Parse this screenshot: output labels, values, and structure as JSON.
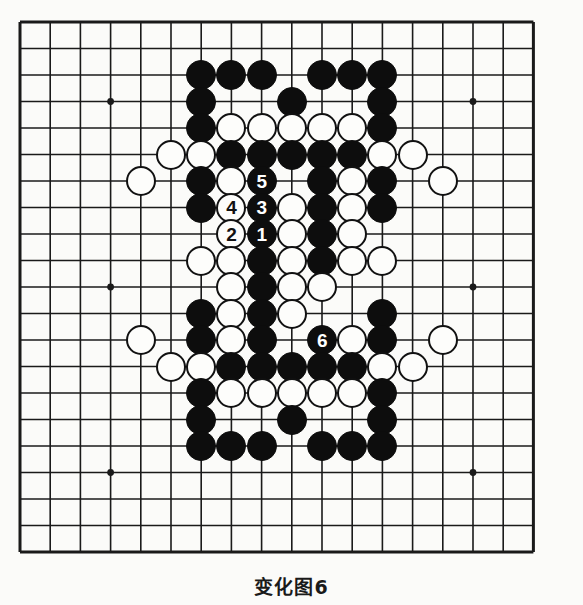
{
  "caption": {
    "text": "变化图6"
  },
  "board": {
    "name": "go-board",
    "cols": 18,
    "rows": 21,
    "origin_x": 20,
    "origin_y": 22,
    "step_x": 30.2,
    "step_y": 26.5,
    "line_color": "#1a1a1a",
    "border_color": "#1a1a1a",
    "background_color": "#fbfbf9",
    "star_points": [
      {
        "c": 3,
        "r": 3
      },
      {
        "c": 3,
        "r": 10
      },
      {
        "c": 3,
        "r": 17
      },
      {
        "c": 15,
        "r": 3
      },
      {
        "c": 15,
        "r": 10
      },
      {
        "c": 15,
        "r": 17
      }
    ],
    "stone_radius": 15,
    "black_color": "#0d0d0d",
    "white_color": "#fdfdfb"
  },
  "stones": [
    {
      "c": 6,
      "r": 2,
      "color": "black",
      "label": ""
    },
    {
      "c": 7,
      "r": 2,
      "color": "black",
      "label": ""
    },
    {
      "c": 8,
      "r": 2,
      "color": "black",
      "label": ""
    },
    {
      "c": 10,
      "r": 2,
      "color": "black",
      "label": ""
    },
    {
      "c": 11,
      "r": 2,
      "color": "black",
      "label": ""
    },
    {
      "c": 12,
      "r": 2,
      "color": "black",
      "label": ""
    },
    {
      "c": 6,
      "r": 3,
      "color": "black",
      "label": ""
    },
    {
      "c": 9,
      "r": 3,
      "color": "black",
      "label": ""
    },
    {
      "c": 12,
      "r": 3,
      "color": "black",
      "label": ""
    },
    {
      "c": 6,
      "r": 4,
      "color": "black",
      "label": ""
    },
    {
      "c": 7,
      "r": 4,
      "color": "white",
      "label": ""
    },
    {
      "c": 8,
      "r": 4,
      "color": "white",
      "label": ""
    },
    {
      "c": 9,
      "r": 4,
      "color": "white",
      "label": ""
    },
    {
      "c": 10,
      "r": 4,
      "color": "white",
      "label": ""
    },
    {
      "c": 11,
      "r": 4,
      "color": "white",
      "label": ""
    },
    {
      "c": 12,
      "r": 4,
      "color": "black",
      "label": ""
    },
    {
      "c": 5,
      "r": 5,
      "color": "white",
      "label": ""
    },
    {
      "c": 6,
      "r": 5,
      "color": "white",
      "label": ""
    },
    {
      "c": 7,
      "r": 5,
      "color": "black",
      "label": ""
    },
    {
      "c": 8,
      "r": 5,
      "color": "black",
      "label": ""
    },
    {
      "c": 9,
      "r": 5,
      "color": "black",
      "label": ""
    },
    {
      "c": 10,
      "r": 5,
      "color": "black",
      "label": ""
    },
    {
      "c": 11,
      "r": 5,
      "color": "black",
      "label": ""
    },
    {
      "c": 12,
      "r": 5,
      "color": "white",
      "label": ""
    },
    {
      "c": 13,
      "r": 5,
      "color": "white",
      "label": ""
    },
    {
      "c": 4,
      "r": 6,
      "color": "white",
      "label": ""
    },
    {
      "c": 6,
      "r": 6,
      "color": "black",
      "label": ""
    },
    {
      "c": 7,
      "r": 6,
      "color": "white",
      "label": ""
    },
    {
      "c": 8,
      "r": 6,
      "color": "black",
      "label": "5"
    },
    {
      "c": 10,
      "r": 6,
      "color": "black",
      "label": ""
    },
    {
      "c": 11,
      "r": 6,
      "color": "white",
      "label": ""
    },
    {
      "c": 12,
      "r": 6,
      "color": "black",
      "label": ""
    },
    {
      "c": 14,
      "r": 6,
      "color": "white",
      "label": ""
    },
    {
      "c": 6,
      "r": 7,
      "color": "black",
      "label": ""
    },
    {
      "c": 7,
      "r": 7,
      "color": "white",
      "label": "4"
    },
    {
      "c": 8,
      "r": 7,
      "color": "black",
      "label": "3"
    },
    {
      "c": 9,
      "r": 7,
      "color": "white",
      "label": ""
    },
    {
      "c": 10,
      "r": 7,
      "color": "black",
      "label": ""
    },
    {
      "c": 11,
      "r": 7,
      "color": "white",
      "label": ""
    },
    {
      "c": 12,
      "r": 7,
      "color": "black",
      "label": ""
    },
    {
      "c": 7,
      "r": 8,
      "color": "white",
      "label": "2"
    },
    {
      "c": 8,
      "r": 8,
      "color": "black",
      "label": "1"
    },
    {
      "c": 9,
      "r": 8,
      "color": "white",
      "label": ""
    },
    {
      "c": 10,
      "r": 8,
      "color": "black",
      "label": ""
    },
    {
      "c": 11,
      "r": 8,
      "color": "white",
      "label": ""
    },
    {
      "c": 6,
      "r": 9,
      "color": "white",
      "label": ""
    },
    {
      "c": 7,
      "r": 9,
      "color": "white",
      "label": ""
    },
    {
      "c": 8,
      "r": 9,
      "color": "black",
      "label": ""
    },
    {
      "c": 9,
      "r": 9,
      "color": "white",
      "label": ""
    },
    {
      "c": 10,
      "r": 9,
      "color": "black",
      "label": ""
    },
    {
      "c": 11,
      "r": 9,
      "color": "white",
      "label": ""
    },
    {
      "c": 12,
      "r": 9,
      "color": "white",
      "label": ""
    },
    {
      "c": 7,
      "r": 10,
      "color": "white",
      "label": ""
    },
    {
      "c": 8,
      "r": 10,
      "color": "black",
      "label": ""
    },
    {
      "c": 9,
      "r": 10,
      "color": "white",
      "label": ""
    },
    {
      "c": 10,
      "r": 10,
      "color": "white",
      "label": ""
    },
    {
      "c": 6,
      "r": 11,
      "color": "black",
      "label": ""
    },
    {
      "c": 7,
      "r": 11,
      "color": "white",
      "label": ""
    },
    {
      "c": 8,
      "r": 11,
      "color": "black",
      "label": ""
    },
    {
      "c": 9,
      "r": 11,
      "color": "white",
      "label": ""
    },
    {
      "c": 12,
      "r": 11,
      "color": "black",
      "label": ""
    },
    {
      "c": 4,
      "r": 12,
      "color": "white",
      "label": ""
    },
    {
      "c": 6,
      "r": 12,
      "color": "black",
      "label": ""
    },
    {
      "c": 7,
      "r": 12,
      "color": "white",
      "label": ""
    },
    {
      "c": 8,
      "r": 12,
      "color": "black",
      "label": ""
    },
    {
      "c": 10,
      "r": 12,
      "color": "black",
      "label": "6"
    },
    {
      "c": 11,
      "r": 12,
      "color": "white",
      "label": ""
    },
    {
      "c": 12,
      "r": 12,
      "color": "black",
      "label": ""
    },
    {
      "c": 14,
      "r": 12,
      "color": "white",
      "label": ""
    },
    {
      "c": 5,
      "r": 13,
      "color": "white",
      "label": ""
    },
    {
      "c": 6,
      "r": 13,
      "color": "white",
      "label": ""
    },
    {
      "c": 7,
      "r": 13,
      "color": "black",
      "label": ""
    },
    {
      "c": 8,
      "r": 13,
      "color": "black",
      "label": ""
    },
    {
      "c": 9,
      "r": 13,
      "color": "black",
      "label": ""
    },
    {
      "c": 10,
      "r": 13,
      "color": "black",
      "label": ""
    },
    {
      "c": 11,
      "r": 13,
      "color": "black",
      "label": ""
    },
    {
      "c": 12,
      "r": 13,
      "color": "white",
      "label": ""
    },
    {
      "c": 13,
      "r": 13,
      "color": "white",
      "label": ""
    },
    {
      "c": 6,
      "r": 14,
      "color": "black",
      "label": ""
    },
    {
      "c": 7,
      "r": 14,
      "color": "white",
      "label": ""
    },
    {
      "c": 8,
      "r": 14,
      "color": "white",
      "label": ""
    },
    {
      "c": 9,
      "r": 14,
      "color": "white",
      "label": ""
    },
    {
      "c": 10,
      "r": 14,
      "color": "white",
      "label": ""
    },
    {
      "c": 11,
      "r": 14,
      "color": "white",
      "label": ""
    },
    {
      "c": 12,
      "r": 14,
      "color": "black",
      "label": ""
    },
    {
      "c": 6,
      "r": 15,
      "color": "black",
      "label": ""
    },
    {
      "c": 9,
      "r": 15,
      "color": "black",
      "label": ""
    },
    {
      "c": 12,
      "r": 15,
      "color": "black",
      "label": ""
    },
    {
      "c": 6,
      "r": 16,
      "color": "black",
      "label": ""
    },
    {
      "c": 7,
      "r": 16,
      "color": "black",
      "label": ""
    },
    {
      "c": 8,
      "r": 16,
      "color": "black",
      "label": ""
    },
    {
      "c": 10,
      "r": 16,
      "color": "black",
      "label": ""
    },
    {
      "c": 11,
      "r": 16,
      "color": "black",
      "label": ""
    },
    {
      "c": 12,
      "r": 16,
      "color": "black",
      "label": ""
    }
  ]
}
